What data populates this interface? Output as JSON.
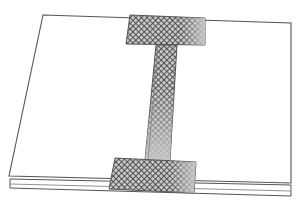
{
  "figure": {
    "colors": {
      "background": "#ffffff",
      "board_fill": "#ffffff",
      "board_edge": "#555555",
      "tape_fill": "#c8c8c8",
      "tape_mesh": "#3a3a3a",
      "tape_edge": "#555555"
    },
    "elements": [
      {
        "name": "upper-board",
        "label": "Upper board"
      },
      {
        "name": "lower-board",
        "label": "Lower board"
      },
      {
        "name": "top-tape-pad",
        "label": "Top mesh tape pad"
      },
      {
        "name": "vertical-tape-strip",
        "label": "Vertical mesh tape strip"
      },
      {
        "name": "bottom-tape-pad",
        "label": "Bottom mesh tape pad"
      }
    ]
  }
}
